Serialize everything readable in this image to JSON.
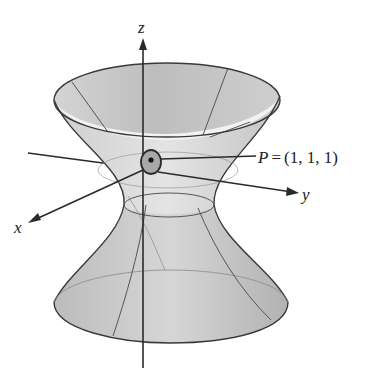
{
  "figure": {
    "type": "hyperboloid-of-one-sheet",
    "axes": {
      "x_label": "x",
      "y_label": "y",
      "z_label": "z"
    },
    "point": {
      "name": "P",
      "equals": "=",
      "coords": "(1, 1, 1)"
    },
    "colors": {
      "surface_light": "#e6e6e6",
      "surface_mid": "#c8c8c8",
      "surface_dark": "#a8a8a8",
      "outline": "#3a3a3a",
      "axis": "#2a2a2a",
      "patch": "#9a9a9a"
    }
  }
}
